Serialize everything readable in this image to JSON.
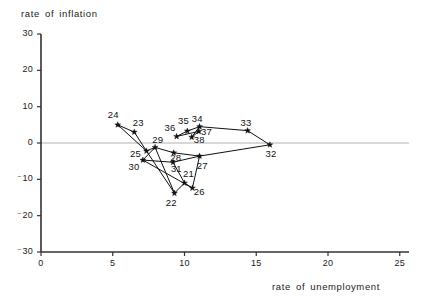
{
  "chart_data": {
    "type": "scatter",
    "title": "",
    "xlabel": "rate of unemployment",
    "ylabel": "rate of inflation",
    "xlim": [
      0,
      26
    ],
    "ylim": [
      -30,
      30
    ],
    "xticks": [
      0,
      5,
      10,
      15,
      20,
      25
    ],
    "xtick_labels": [
      "0",
      "5",
      "10",
      "15",
      "20",
      "25"
    ],
    "yticks": [
      30,
      20,
      10,
      0,
      -10,
      -20,
      -30
    ],
    "ytick_labels": [
      "30",
      "20",
      "10",
      "0",
      "⁻10",
      "⁻20",
      "⁻30"
    ],
    "grid": false,
    "legend": null,
    "zero_line": true,
    "zero_line_color": "#b0b0b0",
    "line_color": "#111111",
    "marker": "star",
    "marker_color": "#111111",
    "connected": true,
    "points": [
      {
        "label": "21",
        "x": 10.0,
        "y": -11.0,
        "lx": 10.25,
        "ly": -8.6
      },
      {
        "label": "22",
        "x": 9.3,
        "y": -13.8,
        "lx": 9.05,
        "ly": -16.6
      },
      {
        "label": "23",
        "x": 6.5,
        "y": 3.0,
        "lx": 6.75,
        "ly": 5.4
      },
      {
        "label": "24",
        "x": 5.35,
        "y": 5.0,
        "lx": 5.0,
        "ly": 7.6
      },
      {
        "label": "25",
        "x": 7.35,
        "y": -2.2,
        "lx": 6.55,
        "ly": -3.1
      },
      {
        "label": "26",
        "x": 10.55,
        "y": -12.4,
        "lx": 11.0,
        "ly": -13.6
      },
      {
        "label": "27",
        "x": 11.05,
        "y": -3.6,
        "lx": 11.2,
        "ly": -6.3
      },
      {
        "label": "28",
        "x": 9.25,
        "y": -2.7,
        "lx": 9.35,
        "ly": -4.2
      },
      {
        "label": "29",
        "x": 7.95,
        "y": -1.2,
        "lx": 8.1,
        "ly": 0.9
      },
      {
        "label": "30",
        "x": 7.1,
        "y": -4.7,
        "lx": 6.45,
        "ly": -6.6
      },
      {
        "label": "31",
        "x": 9.2,
        "y": -5.3,
        "lx": 9.4,
        "ly": -7.2
      },
      {
        "label": "32",
        "x": 15.95,
        "y": -0.5,
        "lx": 16.0,
        "ly": -2.9
      },
      {
        "label": "33",
        "x": 14.4,
        "y": 3.4,
        "lx": 14.25,
        "ly": 5.4
      },
      {
        "label": "34",
        "x": 11.05,
        "y": 4.5,
        "lx": 10.85,
        "ly": 6.5
      },
      {
        "label": "35",
        "x": 10.2,
        "y": 3.3,
        "lx": 9.9,
        "ly": 6.0
      },
      {
        "label": "36",
        "x": 9.45,
        "y": 1.8,
        "lx": 8.95,
        "ly": 4.1
      },
      {
        "label": "37",
        "x": 11.0,
        "y": 3.2,
        "lx": 11.5,
        "ly": 3.0
      },
      {
        "label": "38",
        "x": 10.5,
        "y": 1.6,
        "lx": 11.0,
        "ly": 0.9
      }
    ],
    "path_order": [
      "21",
      "22",
      "23",
      "24",
      "25",
      "26",
      "27",
      "28",
      "29",
      "30",
      "31",
      "32",
      "33",
      "34",
      "35",
      "36",
      "37",
      "38"
    ],
    "segments": [
      [
        "24",
        "23"
      ],
      [
        "23",
        "25"
      ],
      [
        "24",
        "25"
      ],
      [
        "25",
        "29"
      ],
      [
        "29",
        "28"
      ],
      [
        "28",
        "27"
      ],
      [
        "27",
        "32"
      ],
      [
        "32",
        "33"
      ],
      [
        "33",
        "34"
      ],
      [
        "34",
        "35"
      ],
      [
        "35",
        "36"
      ],
      [
        "36",
        "37"
      ],
      [
        "37",
        "38"
      ],
      [
        "38",
        "34"
      ],
      [
        "30",
        "29"
      ],
      [
        "30",
        "31"
      ],
      [
        "31",
        "27"
      ],
      [
        "29",
        "22"
      ],
      [
        "25",
        "22"
      ],
      [
        "30",
        "26"
      ],
      [
        "31",
        "21"
      ],
      [
        "22",
        "21"
      ],
      [
        "21",
        "26"
      ],
      [
        "26",
        "27"
      ]
    ]
  },
  "geometry": {
    "x0_px": 41,
    "y0_px": 143,
    "px_per_x": 14.35,
    "px_per_y": 3.633,
    "axis_top_px": 34,
    "axis_bottom_px": 252,
    "axis_right_px": 409
  }
}
